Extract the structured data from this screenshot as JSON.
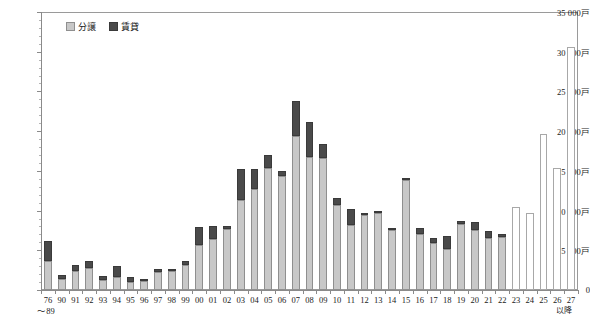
{
  "chart_data": {
    "type": "bar",
    "stacked": true,
    "title": "",
    "xlabel": "",
    "ylabel": "",
    "ylim": [
      0,
      35000
    ],
    "ytick_values": [
      0,
      5000,
      10000,
      15000,
      20000,
      25000,
      30000,
      35000
    ],
    "ytick_labels": [
      "0",
      "5 000戸",
      "10 000戸",
      "15 000戸",
      "20 000戸",
      "25 000戸",
      "30 000戸",
      "35 000戸"
    ],
    "y_unit": "戸",
    "grid": false,
    "legend_position": "top-left",
    "categories": [
      "76\n〜89",
      "90",
      "91",
      "92",
      "93",
      "94",
      "95",
      "96",
      "97",
      "98",
      "99",
      "00",
      "01",
      "02",
      "03",
      "04",
      "05",
      "06",
      "07",
      "08",
      "09",
      "10",
      "11",
      "12",
      "13",
      "14",
      "15",
      "16",
      "17",
      "18",
      "19",
      "20",
      "21",
      "22",
      "23",
      "24",
      "25",
      "26",
      "27"
    ],
    "tick_suffix": "以降",
    "series": [
      {
        "name": "分譲",
        "color": "#c8c8c8",
        "values": [
          3700,
          1400,
          2400,
          2800,
          1200,
          1700,
          1000,
          1100,
          2300,
          2400,
          3100,
          5700,
          6400,
          7700,
          11300,
          12700,
          15400,
          14300,
          19400,
          16800,
          16600,
          10700,
          8200,
          9400,
          9700,
          7600,
          13800,
          7100,
          5900,
          5200,
          8300,
          7500,
          6600,
          6700,
          4000,
          0,
          0,
          0,
          0
        ]
      },
      {
        "name": "賃貸",
        "color": "#4a4a4a",
        "values": [
          2500,
          500,
          700,
          800,
          600,
          1300,
          700,
          300,
          400,
          300,
          600,
          2200,
          1700,
          300,
          3900,
          2500,
          1600,
          700,
          4400,
          4300,
          1800,
          900,
          2000,
          200,
          200,
          100,
          300,
          700,
          600,
          1600,
          400,
          1100,
          800,
          300,
          0,
          0,
          0,
          0,
          0
        ]
      },
      {
        "name": "未定",
        "color": "#ffffff",
        "values": [
          0,
          0,
          0,
          0,
          0,
          0,
          0,
          0,
          0,
          0,
          0,
          0,
          0,
          0,
          0,
          0,
          0,
          0,
          0,
          0,
          0,
          0,
          0,
          0,
          0,
          0,
          0,
          0,
          0,
          0,
          0,
          0,
          0,
          0,
          10400,
          9700,
          19700,
          15400,
          30600
        ]
      }
    ]
  },
  "legend": {
    "items": [
      {
        "label": "分譲",
        "swatch": "sw-bunjo"
      },
      {
        "label": "賃貸",
        "swatch": "sw-chintai"
      }
    ]
  }
}
